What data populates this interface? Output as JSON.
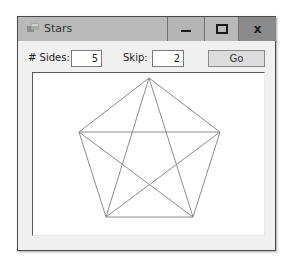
{
  "window": {
    "title": "Stars",
    "buttons": {
      "minimize": "minimize",
      "maximize": "maximize",
      "close": "x"
    }
  },
  "controls": {
    "sides_label": "# Sides:",
    "sides_value": "5",
    "skip_label": "Skip:",
    "skip_value": "2",
    "go_label": "Go"
  },
  "drawing": {
    "shape": "star polygon {5/2} with outer pentagon",
    "stroke_color": "#8c8c8c",
    "vertices": [
      {
        "x": 148,
        "y": 77
      },
      {
        "x": 219,
        "y": 131
      },
      {
        "x": 192,
        "y": 216
      },
      {
        "x": 105,
        "y": 216
      },
      {
        "x": 78,
        "y": 131
      }
    ]
  },
  "colors": {
    "titlebar": "#b9b9b9",
    "close_button": "#8a8a8a",
    "window_bg": "#f0f0f0",
    "canvas_bg": "#ffffff",
    "go_button": "#dcdcdc"
  }
}
